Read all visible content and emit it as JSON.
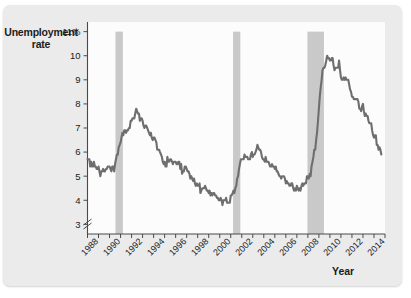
{
  "card": {
    "background_color": "#ebebeb"
  },
  "chart_data": {
    "type": "line",
    "title": "",
    "ylabel_line1": "Unemployment",
    "ylabel_line2": "rate",
    "xlabel": "Year",
    "ylim": [
      2.6,
      11.4
    ],
    "xlim": [
      1988.0,
      2015.0
    ],
    "grid": false,
    "legend": "none",
    "line_color": "#6e6e6e",
    "band_color": "#c9c9c9",
    "plot_background": "#fcfcfc",
    "axis_break": true,
    "yticks": [
      3,
      4,
      5,
      6,
      7,
      8,
      9,
      10,
      11
    ],
    "ytick_labels": [
      "3",
      "4",
      "5",
      "6",
      "7",
      "8",
      "9",
      "10",
      "11%"
    ],
    "xticks": [
      1988,
      1990,
      1992,
      1994,
      1996,
      1998,
      2000,
      2002,
      2004,
      2006,
      2008,
      2010,
      2012,
      2014
    ],
    "xtick_labels": [
      "1988",
      "1990",
      "1992",
      "1994",
      "1996",
      "1998",
      "2000",
      "2002",
      "2004",
      "2006",
      "2008",
      "2010",
      "2012",
      "2014"
    ],
    "xtick_minor_step": 1,
    "recession_bands": [
      {
        "name": "1990-91 recession",
        "start": 1990.54,
        "end": 1991.21
      },
      {
        "name": "2001 recession",
        "start": 2001.21,
        "end": 2001.87
      },
      {
        "name": "2007-09 recession",
        "start": 2007.96,
        "end": 2009.46
      }
    ],
    "series": [
      {
        "name": "Unemployment rate",
        "units": "percent",
        "x": [
          1988.0,
          1988.08,
          1988.17,
          1988.25,
          1988.33,
          1988.42,
          1988.5,
          1988.58,
          1988.67,
          1988.75,
          1988.83,
          1988.92,
          1989.0,
          1989.08,
          1989.17,
          1989.25,
          1989.33,
          1989.42,
          1989.5,
          1989.58,
          1989.67,
          1989.75,
          1989.83,
          1989.92,
          1990.0,
          1990.08,
          1990.17,
          1990.25,
          1990.33,
          1990.42,
          1990.5,
          1990.58,
          1990.67,
          1990.75,
          1990.83,
          1990.92,
          1991.0,
          1991.08,
          1991.17,
          1991.25,
          1991.33,
          1991.42,
          1991.5,
          1991.58,
          1991.67,
          1991.75,
          1991.83,
          1991.92,
          1992.0,
          1992.08,
          1992.17,
          1992.25,
          1992.33,
          1992.42,
          1992.5,
          1992.58,
          1992.67,
          1992.75,
          1992.83,
          1992.92,
          1993.0,
          1993.08,
          1993.17,
          1993.25,
          1993.33,
          1993.42,
          1993.5,
          1993.58,
          1993.67,
          1993.75,
          1993.83,
          1993.92,
          1994.0,
          1994.08,
          1994.17,
          1994.25,
          1994.33,
          1994.42,
          1994.5,
          1994.58,
          1994.67,
          1994.75,
          1994.83,
          1994.92,
          1995.0,
          1995.08,
          1995.17,
          1995.25,
          1995.33,
          1995.42,
          1995.5,
          1995.58,
          1995.67,
          1995.75,
          1995.83,
          1995.92,
          1996.0,
          1996.08,
          1996.17,
          1996.25,
          1996.33,
          1996.42,
          1996.5,
          1996.58,
          1996.67,
          1996.75,
          1996.83,
          1996.92,
          1997.0,
          1997.08,
          1997.17,
          1997.25,
          1997.33,
          1997.42,
          1997.5,
          1997.58,
          1997.67,
          1997.75,
          1997.83,
          1997.92,
          1998.0,
          1998.08,
          1998.17,
          1998.25,
          1998.33,
          1998.42,
          1998.5,
          1998.58,
          1998.67,
          1998.75,
          1998.83,
          1998.92,
          1999.0,
          1999.08,
          1999.17,
          1999.25,
          1999.33,
          1999.42,
          1999.5,
          1999.58,
          1999.67,
          1999.75,
          1999.83,
          1999.92,
          2000.0,
          2000.08,
          2000.17,
          2000.25,
          2000.33,
          2000.42,
          2000.5,
          2000.58,
          2000.67,
          2000.75,
          2000.83,
          2000.92,
          2001.0,
          2001.08,
          2001.17,
          2001.25,
          2001.33,
          2001.42,
          2001.5,
          2001.58,
          2001.67,
          2001.75,
          2001.83,
          2001.92,
          2002.0,
          2002.08,
          2002.17,
          2002.25,
          2002.33,
          2002.42,
          2002.5,
          2002.58,
          2002.67,
          2002.75,
          2002.83,
          2002.92,
          2003.0,
          2003.08,
          2003.17,
          2003.25,
          2003.33,
          2003.42,
          2003.5,
          2003.58,
          2003.67,
          2003.75,
          2003.83,
          2003.92,
          2004.0,
          2004.08,
          2004.17,
          2004.25,
          2004.33,
          2004.42,
          2004.5,
          2004.58,
          2004.67,
          2004.75,
          2004.83,
          2004.92,
          2005.0,
          2005.08,
          2005.17,
          2005.25,
          2005.33,
          2005.42,
          2005.5,
          2005.58,
          2005.67,
          2005.75,
          2005.83,
          2005.92,
          2006.0,
          2006.08,
          2006.17,
          2006.25,
          2006.33,
          2006.42,
          2006.5,
          2006.58,
          2006.67,
          2006.75,
          2006.83,
          2006.92,
          2007.0,
          2007.08,
          2007.17,
          2007.25,
          2007.33,
          2007.42,
          2007.5,
          2007.58,
          2007.67,
          2007.75,
          2007.83,
          2007.92,
          2008.0,
          2008.08,
          2008.17,
          2008.25,
          2008.33,
          2008.42,
          2008.5,
          2008.58,
          2008.67,
          2008.75,
          2008.83,
          2008.92,
          2009.0,
          2009.08,
          2009.17,
          2009.25,
          2009.33,
          2009.42,
          2009.5,
          2009.58,
          2009.67,
          2009.75,
          2009.83,
          2009.92,
          2010.0,
          2010.08,
          2010.17,
          2010.25,
          2010.33,
          2010.42,
          2010.5,
          2010.58,
          2010.67,
          2010.75,
          2010.83,
          2010.92,
          2011.0,
          2011.08,
          2011.17,
          2011.25,
          2011.33,
          2011.42,
          2011.5,
          2011.58,
          2011.67,
          2011.75,
          2011.83,
          2011.92,
          2012.0,
          2012.08,
          2012.17,
          2012.25,
          2012.33,
          2012.42,
          2012.5,
          2012.58,
          2012.67,
          2012.75,
          2012.83,
          2012.92,
          2013.0,
          2013.08,
          2013.17,
          2013.25,
          2013.33,
          2013.42,
          2013.5,
          2013.58,
          2013.67,
          2013.75,
          2013.83,
          2013.92,
          2014.0,
          2014.08,
          2014.17,
          2014.25,
          2014.33,
          2014.42,
          2014.5,
          2014.58,
          2014.67
        ],
        "values": [
          5.7,
          5.7,
          5.7,
          5.4,
          5.6,
          5.4,
          5.4,
          5.6,
          5.4,
          5.4,
          5.3,
          5.3,
          5.4,
          5.2,
          5.0,
          5.2,
          5.2,
          5.3,
          5.2,
          5.2,
          5.3,
          5.3,
          5.4,
          5.4,
          5.4,
          5.3,
          5.2,
          5.4,
          5.4,
          5.2,
          5.5,
          5.7,
          5.9,
          5.9,
          6.2,
          6.3,
          6.4,
          6.6,
          6.8,
          6.7,
          6.9,
          6.9,
          6.8,
          6.9,
          6.9,
          7.0,
          7.0,
          7.3,
          7.3,
          7.4,
          7.4,
          7.4,
          7.6,
          7.8,
          7.7,
          7.6,
          7.6,
          7.3,
          7.4,
          7.4,
          7.3,
          7.1,
          7.0,
          7.1,
          7.1,
          7.0,
          6.9,
          6.8,
          6.7,
          6.8,
          6.6,
          6.5,
          6.6,
          6.6,
          6.5,
          6.4,
          6.1,
          6.1,
          6.1,
          6.0,
          5.9,
          5.8,
          5.6,
          5.5,
          5.6,
          5.4,
          5.4,
          5.8,
          5.6,
          5.6,
          5.7,
          5.7,
          5.6,
          5.5,
          5.6,
          5.6,
          5.6,
          5.5,
          5.5,
          5.6,
          5.6,
          5.3,
          5.5,
          5.1,
          5.2,
          5.2,
          5.4,
          5.4,
          5.3,
          5.2,
          5.2,
          5.1,
          4.9,
          5.0,
          4.9,
          4.8,
          4.9,
          4.7,
          4.6,
          4.7,
          4.6,
          4.6,
          4.7,
          4.3,
          4.4,
          4.5,
          4.5,
          4.5,
          4.6,
          4.5,
          4.4,
          4.4,
          4.3,
          4.4,
          4.2,
          4.3,
          4.2,
          4.3,
          4.3,
          4.2,
          4.2,
          4.1,
          4.1,
          4.0,
          4.0,
          4.1,
          4.0,
          3.8,
          4.0,
          4.0,
          4.0,
          4.1,
          3.9,
          3.9,
          3.9,
          3.9,
          4.2,
          4.2,
          4.3,
          4.4,
          4.3,
          4.5,
          4.6,
          4.9,
          5.0,
          5.3,
          5.5,
          5.7,
          5.7,
          5.7,
          5.7,
          5.9,
          5.8,
          5.8,
          5.8,
          5.7,
          5.7,
          5.7,
          5.9,
          6.0,
          5.8,
          5.9,
          5.9,
          6.0,
          6.1,
          6.3,
          6.2,
          6.1,
          6.1,
          6.0,
          5.8,
          5.7,
          5.7,
          5.6,
          5.8,
          5.6,
          5.6,
          5.6,
          5.5,
          5.4,
          5.4,
          5.5,
          5.4,
          5.4,
          5.3,
          5.4,
          5.2,
          5.2,
          5.1,
          5.0,
          5.0,
          4.9,
          5.0,
          5.0,
          5.0,
          4.9,
          4.7,
          4.8,
          4.7,
          4.7,
          4.6,
          4.6,
          4.7,
          4.7,
          4.5,
          4.4,
          4.5,
          4.4,
          4.6,
          4.5,
          4.4,
          4.5,
          4.4,
          4.6,
          4.7,
          4.6,
          4.7,
          4.7,
          4.7,
          5.0,
          5.0,
          4.9,
          5.1,
          5.0,
          5.4,
          5.6,
          5.8,
          6.1,
          6.1,
          6.5,
          6.8,
          7.3,
          7.8,
          8.3,
          8.7,
          9.0,
          9.4,
          9.5,
          9.5,
          9.6,
          9.8,
          10.0,
          9.9,
          9.9,
          9.8,
          9.8,
          9.9,
          9.9,
          9.6,
          9.4,
          9.5,
          9.5,
          9.5,
          9.5,
          9.8,
          9.4,
          9.1,
          9.0,
          9.0,
          9.1,
          9.0,
          9.1,
          9.0,
          9.0,
          9.0,
          8.8,
          8.6,
          8.5,
          8.3,
          8.3,
          8.2,
          8.2,
          8.2,
          8.2,
          8.2,
          8.1,
          7.8,
          7.8,
          7.7,
          7.9,
          8.0,
          7.7,
          7.5,
          7.6,
          7.5,
          7.5,
          7.3,
          7.2,
          7.2,
          7.2,
          6.9,
          6.7,
          6.6,
          6.7,
          6.7,
          6.3,
          6.3,
          6.1,
          6.2,
          6.1,
          5.9
        ]
      }
    ]
  }
}
